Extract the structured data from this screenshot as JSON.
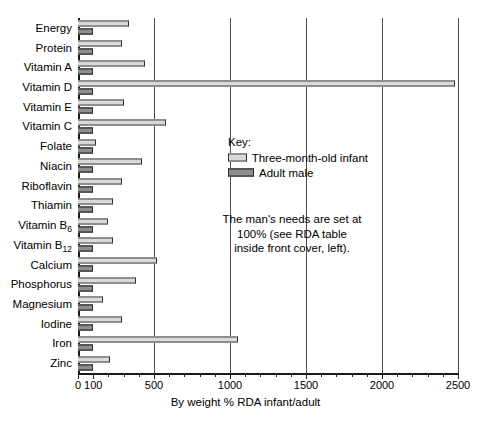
{
  "chart_data": {
    "type": "bar",
    "orientation": "horizontal",
    "title": "",
    "xlabel": "By weight % RDA infant/adult",
    "ylabel": "",
    "xlim": [
      0,
      2500
    ],
    "xticks": [
      0,
      100,
      500,
      1000,
      1500,
      2000,
      2500
    ],
    "xtick_labels": [
      "0",
      "100",
      "500",
      "1000",
      "1500",
      "2000",
      "2500"
    ],
    "minor_tick_step": 100,
    "grid": "vertical gridlines at 500, 1000, 1500, 2000, 2500",
    "legend_position": "inside-right",
    "categories": [
      "Energy",
      "Protein",
      "Vitamin A",
      "Vitamin D",
      "Vitamin E",
      "Vitamin C",
      "Folate",
      "Niacin",
      "Riboflavin",
      "Thiamin",
      "Vitamin B6",
      "Vitamin B12",
      "Calcium",
      "Phosphorus",
      "Magnesium",
      "Iodine",
      "Iron",
      "Zinc"
    ],
    "category_labels": [
      {
        "text": "Energy",
        "sub": ""
      },
      {
        "text": "Protein",
        "sub": ""
      },
      {
        "text": "Vitamin A",
        "sub": ""
      },
      {
        "text": "Vitamin D",
        "sub": ""
      },
      {
        "text": "Vitamin E",
        "sub": ""
      },
      {
        "text": "Vitamin C",
        "sub": ""
      },
      {
        "text": "Folate",
        "sub": ""
      },
      {
        "text": "Niacin",
        "sub": ""
      },
      {
        "text": "Riboflavin",
        "sub": ""
      },
      {
        "text": "Thiamin",
        "sub": ""
      },
      {
        "text": "Vitamin B",
        "sub": "6"
      },
      {
        "text": "Vitamin B",
        "sub": "12"
      },
      {
        "text": "Calcium",
        "sub": ""
      },
      {
        "text": "Phosphorus",
        "sub": ""
      },
      {
        "text": "Magnesium",
        "sub": ""
      },
      {
        "text": "Iodine",
        "sub": ""
      },
      {
        "text": "Iron",
        "sub": ""
      },
      {
        "text": "Zinc",
        "sub": ""
      }
    ],
    "series": [
      {
        "name": "Three-month-old infant",
        "color": "#d9d9d9",
        "values": [
          335,
          290,
          440,
          2480,
          300,
          580,
          120,
          420,
          290,
          230,
          200,
          230,
          520,
          380,
          165,
          290,
          1050,
          210
        ]
      },
      {
        "name": "Adult male",
        "color": "#8d8d8d",
        "values": [
          100,
          100,
          100,
          100,
          100,
          100,
          100,
          100,
          100,
          100,
          100,
          100,
          100,
          100,
          100,
          100,
          100,
          100
        ]
      }
    ]
  },
  "key": {
    "title": "Key:",
    "entries": [
      {
        "label": "Three-month-old infant",
        "swatch": "infant"
      },
      {
        "label": "Adult male",
        "swatch": "adult"
      }
    ]
  },
  "note": {
    "text": "The man's needs are set at 100% (see RDA table inside front cover, left)."
  },
  "colors": {
    "infant_fill": "#d9d9d9",
    "adult_fill": "#8d8d8d",
    "axis": "#1a1a1a",
    "gridline": "#4d4d4d",
    "background": "#ffffff"
  }
}
